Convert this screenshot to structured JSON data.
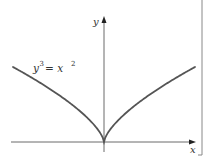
{
  "chart_data": {
    "type": "line",
    "title": "",
    "xlabel": "x",
    "ylabel": "y",
    "series": [
      {
        "name": "y^3 = x^2",
        "equation": "y = x^(2/3)",
        "x": [
          -8,
          -4,
          -1,
          0,
          1,
          4,
          8
        ],
        "y": [
          4,
          2.52,
          1,
          0,
          1,
          2.52,
          4
        ]
      }
    ],
    "annotations": [
      {
        "text": "y³ = x²",
        "position": "upper-left of curve"
      }
    ],
    "grid": false,
    "legend": "none"
  },
  "labels": {
    "x_axis": "x",
    "y_axis": "y",
    "curve_label_base": "y",
    "curve_label_exp1": "3",
    "curve_label_mid": " = x",
    "curve_label_exp2": "2"
  },
  "colors": {
    "curve": "#555555",
    "axis": "#333333"
  }
}
